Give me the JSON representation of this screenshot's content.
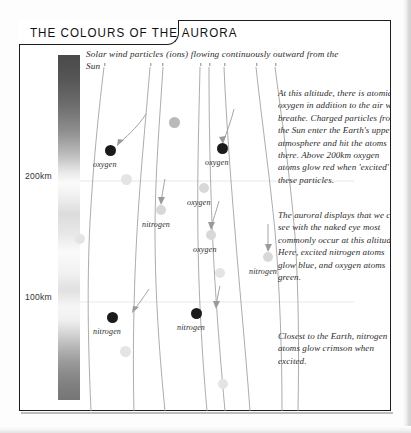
{
  "panel": {
    "title": "THE COLOURS OF THE AURORA"
  },
  "diagram": {
    "top_caption": "Solar wind particles (ions) flowing continuously outward from the Sun",
    "altitude_labels": [
      {
        "text": "200km"
      },
      {
        "text": "100km"
      }
    ],
    "atom_labels": [
      {
        "text": "oxygen"
      },
      {
        "text": "oxygen"
      },
      {
        "text": "nitrogen"
      },
      {
        "text": "oxygen"
      },
      {
        "text": "oxygen"
      },
      {
        "text": "nitrogen"
      },
      {
        "text": "nitrogen"
      },
      {
        "text": "nitrogen"
      }
    ]
  },
  "notes": {
    "upper": "At this altitude, there is atomic oxygen in addition to the air we breathe. Charged particles from the Sun enter the Earth's upper atmosphere and hit the atoms there. Above 200km oxygen atoms glow red when 'excited' by these particles.",
    "middle": "The auroral displays that we can see with the naked eye most commonly occur at this altitude. Here, excited nitrogen atoms glow blue, and oxygen atoms green.",
    "lower": "Closest to the Earth, nitrogen atoms glow crimson when excited."
  },
  "colors": {
    "frame": "#1c1c1c",
    "text": "#2b2b2b",
    "atom_dark": "#1a1a1a",
    "atom_pale": "#d8d8d8",
    "flow_line": "#9a9a9a"
  }
}
